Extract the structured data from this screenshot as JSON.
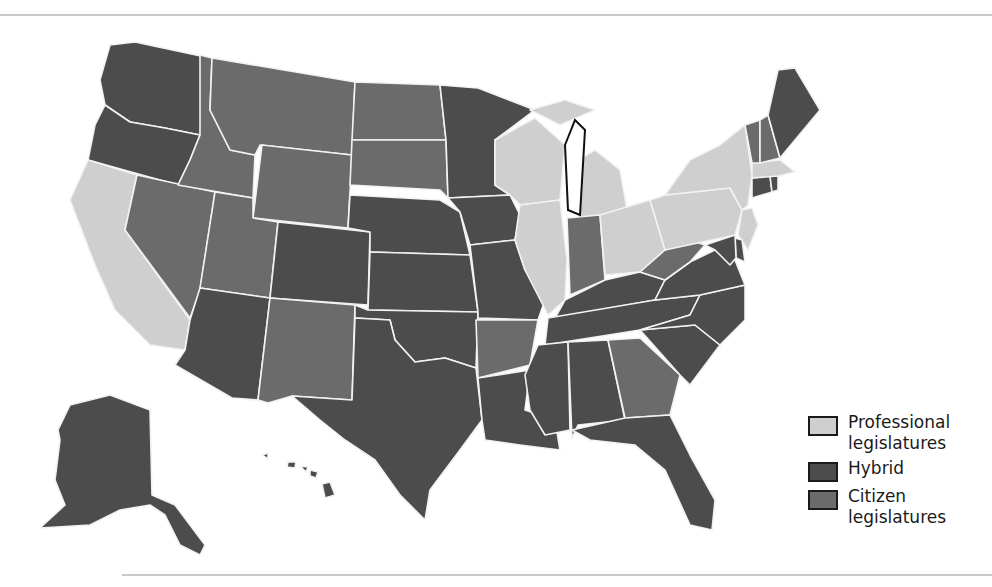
{
  "legend": {
    "items": [
      {
        "key": "professional",
        "label_line1": "Professional",
        "label_line2": "legislatures",
        "color": "#cfcfcf"
      },
      {
        "key": "hybrid",
        "label_line1": "Hybrid",
        "label_line2": "",
        "color": "#4c4c4c"
      },
      {
        "key": "citizen",
        "label_line1": "Citizen",
        "label_line2": "legislatures",
        "color": "#6b6b6b"
      }
    ]
  },
  "colors": {
    "professional": "#cfcfcf",
    "hybrid": "#4c4c4c",
    "citizen": "#6b6b6b",
    "border": "#f2f2f2",
    "coast": "#111111",
    "rule": "#c9c9c9"
  },
  "states": {
    "WA": "hybrid",
    "OR": "hybrid",
    "CA": "professional",
    "NV": "citizen",
    "ID": "citizen",
    "MT": "citizen",
    "WY": "citizen",
    "UT": "citizen",
    "CO": "hybrid",
    "AZ": "hybrid",
    "NM": "citizen",
    "ND": "citizen",
    "SD": "citizen",
    "NE": "hybrid",
    "KS": "hybrid",
    "OK": "hybrid",
    "TX": "hybrid",
    "MN": "hybrid",
    "IA": "hybrid",
    "MO": "hybrid",
    "AR": "citizen",
    "LA": "hybrid",
    "WI": "professional",
    "IL": "professional",
    "MI": "professional",
    "IN": "citizen",
    "OH": "professional",
    "KY": "hybrid",
    "TN": "hybrid",
    "MS": "hybrid",
    "AL": "hybrid",
    "GA": "citizen",
    "FL": "hybrid",
    "SC": "hybrid",
    "NC": "hybrid",
    "VA": "hybrid",
    "WV": "citizen",
    "PA": "professional",
    "NY": "professional",
    "NJ": "professional",
    "DE": "hybrid",
    "MD": "hybrid",
    "CT": "hybrid",
    "RI": "hybrid",
    "MA": "professional",
    "VT": "citizen",
    "NH": "citizen",
    "ME": "hybrid",
    "AK": "hybrid",
    "HI": "hybrid"
  }
}
